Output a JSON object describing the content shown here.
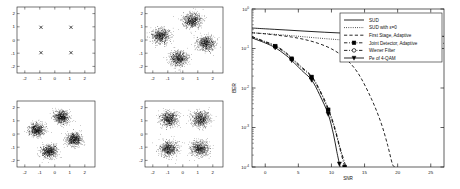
{
  "figure": {
    "background": "#ffffff",
    "axis_color": "#1a1a1a",
    "data_color": "#000000"
  },
  "chart_data": [
    {
      "id": "ideal-constellation",
      "type": "scatter",
      "title": "",
      "xlabel": "",
      "ylabel": "",
      "xlim": [
        -2.6,
        2.6
      ],
      "ylim": [
        -2.6,
        2.6
      ],
      "xticks": [
        -2,
        -1,
        0,
        1,
        2
      ],
      "yticks": [
        -2,
        -1,
        0,
        1,
        2
      ],
      "xticklabels": [
        "-2",
        "-1",
        "0",
        "1",
        "2"
      ],
      "yticklabels": [
        "-2",
        "-1",
        "0",
        "1",
        "2"
      ],
      "grid": false,
      "legend": "none",
      "marker": "x",
      "series": [
        {
          "name": "Ideal 4-QAM constellation points",
          "x": [
            -1,
            1,
            -1,
            1
          ],
          "y": [
            1,
            1,
            -1,
            -1
          ]
        }
      ]
    },
    {
      "id": "received-rotated-noisy",
      "type": "scatter",
      "title": "",
      "xlabel": "",
      "ylabel": "",
      "xlim": [
        -2.6,
        2.6
      ],
      "ylim": [
        -2.6,
        2.6
      ],
      "xticks": [
        -2,
        -1,
        0,
        1,
        2
      ],
      "yticks": [
        -2,
        -1,
        0,
        1,
        2
      ],
      "xticklabels": [
        "-2",
        "-1",
        "0",
        "1",
        "2"
      ],
      "yticklabels": [
        "-2",
        "-1",
        "0",
        "1",
        "2"
      ],
      "grid": false,
      "legend": "none",
      "marker": "dot",
      "cluster_rotation_deg": 32,
      "cluster_radius": 1.6,
      "cluster_spread": 0.3,
      "points_per_cluster": 700,
      "series": [
        {
          "name": "cluster-1",
          "center": [
            0.55,
            1.55
          ]
        },
        {
          "name": "cluster-2",
          "center": [
            -1.55,
            0.35
          ]
        },
        {
          "name": "cluster-3",
          "center": [
            1.45,
            -0.25
          ]
        },
        {
          "name": "cluster-4",
          "center": [
            -0.35,
            -1.45
          ]
        }
      ]
    },
    {
      "id": "partially-equalized-rotated",
      "type": "scatter",
      "title": "",
      "xlabel": "",
      "ylabel": "",
      "xlim": [
        -2.6,
        2.6
      ],
      "ylim": [
        -2.6,
        2.6
      ],
      "xticks": [
        -2,
        -1,
        0,
        1,
        2
      ],
      "yticks": [
        -2,
        -1,
        0,
        1,
        2
      ],
      "xticklabels": [
        "-2",
        "-1",
        "0",
        "1",
        "2"
      ],
      "yticklabels": [
        "-2",
        "-1",
        "0",
        "1",
        "2"
      ],
      "grid": false,
      "legend": "none",
      "marker": "dot",
      "cluster_rotation_deg": 25,
      "cluster_radius": 1.5,
      "cluster_spread": 0.26,
      "points_per_cluster": 700,
      "series": [
        {
          "name": "cluster-1",
          "center": [
            0.35,
            1.35
          ]
        },
        {
          "name": "cluster-2",
          "center": [
            -1.3,
            0.35
          ]
        },
        {
          "name": "cluster-3",
          "center": [
            1.2,
            -0.4
          ]
        },
        {
          "name": "cluster-4",
          "center": [
            -0.45,
            -1.35
          ]
        }
      ]
    },
    {
      "id": "equalized-aligned",
      "type": "scatter",
      "title": "",
      "xlabel": "",
      "ylabel": "",
      "xlim": [
        -2.6,
        2.6
      ],
      "ylim": [
        -2.6,
        2.6
      ],
      "xticks": [
        -2,
        -1,
        0,
        1,
        2
      ],
      "yticks": [
        -2,
        -1,
        0,
        1,
        2
      ],
      "xticklabels": [
        "-2",
        "-1",
        "0",
        "1",
        "2"
      ],
      "yticklabels": [
        "-2",
        "-1",
        "0",
        "1",
        "2"
      ],
      "grid": false,
      "legend": "none",
      "marker": "dot",
      "cluster_rotation_deg": 0,
      "cluster_radius": 1.4,
      "cluster_spread": 0.3,
      "points_per_cluster": 700,
      "series": [
        {
          "name": "cluster-1",
          "center": [
            -1.0,
            1.2
          ]
        },
        {
          "name": "cluster-2",
          "center": [
            1.1,
            1.2
          ]
        },
        {
          "name": "cluster-3",
          "center": [
            -1.05,
            -1.15
          ]
        },
        {
          "name": "cluster-4",
          "center": [
            1.05,
            -1.15
          ]
        }
      ]
    },
    {
      "id": "ber-vs-snr",
      "type": "line",
      "title": "",
      "xlabel": "SNR",
      "ylabel": "BER",
      "xlim": [
        -2,
        27
      ],
      "ylim": [
        0.0001,
        1
      ],
      "yscale": "log",
      "xticks": [
        0,
        5,
        10,
        15,
        20,
        25
      ],
      "xticklabels": [
        "0",
        "5",
        "10",
        "15",
        "20",
        "25"
      ],
      "yticks": [
        1,
        0.1,
        0.01,
        0.001,
        0.0001
      ],
      "yticklabels": [
        "10^0",
        "10^-1",
        "10^-2",
        "10^-3",
        "10^-4"
      ],
      "grid": false,
      "legend_position": "upper right",
      "series": [
        {
          "name": "SUD",
          "style": "solid",
          "marker": "none",
          "x": [
            -2,
            0,
            3,
            6,
            9,
            12,
            15,
            18,
            21,
            24,
            27
          ],
          "y": [
            0.33,
            0.315,
            0.295,
            0.275,
            0.258,
            0.244,
            0.232,
            0.222,
            0.214,
            0.208,
            0.203
          ]
        },
        {
          "name": "SUD with ε=0",
          "style": "dotted",
          "marker": "none",
          "x": [
            -2,
            0,
            3,
            6,
            9,
            12,
            15,
            18,
            21,
            24,
            27
          ],
          "y": [
            0.25,
            0.238,
            0.218,
            0.197,
            0.178,
            0.163,
            0.152,
            0.145,
            0.14,
            0.137,
            0.135
          ]
        },
        {
          "name": "First Stage, Adaptive",
          "style": "dashed",
          "marker": "none",
          "x": [
            -2,
            0,
            2,
            4,
            6,
            8,
            10,
            12,
            14,
            16,
            17.5,
            18.5,
            19.2,
            19.6
          ],
          "y": [
            0.25,
            0.235,
            0.215,
            0.195,
            0.168,
            0.135,
            0.098,
            0.058,
            0.024,
            0.0055,
            0.0013,
            0.00035,
            0.00012,
            0.0001
          ]
        },
        {
          "name": "Joint Detector, Adaptive",
          "style": "dashdot",
          "marker": "square",
          "markers_x": [
            1.5,
            4,
            7,
            9.5,
            12
          ],
          "markers_y": [
            0.115,
            0.055,
            0.019,
            0.0028,
            0.0001
          ],
          "x": [
            -2,
            0,
            1.5,
            3,
            4,
            5.5,
            7,
            8.2,
            9.5,
            10.5,
            11.3,
            12
          ],
          "y": [
            0.195,
            0.145,
            0.115,
            0.078,
            0.055,
            0.032,
            0.019,
            0.0085,
            0.0028,
            0.0009,
            0.00028,
            0.0001
          ]
        },
        {
          "name": "Wiener Filter",
          "style": "dashed-circle",
          "marker": "circle",
          "markers_x": [],
          "markers_y": [],
          "x": [
            -2,
            0,
            1.5,
            3,
            4,
            5.5,
            7,
            8.2,
            9.5,
            10.5,
            11.3,
            12.2
          ],
          "y": [
            0.2,
            0.15,
            0.12,
            0.082,
            0.058,
            0.034,
            0.02,
            0.0092,
            0.0031,
            0.001,
            0.00031,
            0.0001
          ]
        },
        {
          "name": "Pe of 4-QAM",
          "style": "solid-marker",
          "marker": "triangle-down",
          "markers_x": [
            1.5,
            4,
            7,
            9.5,
            11.2
          ],
          "markers_y": [
            0.105,
            0.05,
            0.016,
            0.0022,
            0.00012
          ],
          "x": [
            -2,
            0,
            1.5,
            3,
            4,
            5.5,
            7,
            8.2,
            9.5,
            10.3,
            10.8,
            11.3
          ],
          "y": [
            0.185,
            0.138,
            0.105,
            0.07,
            0.05,
            0.028,
            0.016,
            0.0068,
            0.0022,
            0.00068,
            0.00025,
            0.0001
          ]
        }
      ]
    }
  ],
  "legend": {
    "items": [
      {
        "label": "SUD",
        "style": "solid",
        "marker": "none"
      },
      {
        "label": "SUD with ε=0",
        "style": "dotted",
        "marker": "none"
      },
      {
        "label": "First Stage, Adaptive",
        "style": "dashed",
        "marker": "none"
      },
      {
        "label": "Joint Detector, Adaptive",
        "style": "dashdot",
        "marker": "square"
      },
      {
        "label": "Wiener Filter",
        "style": "dashdot",
        "marker": "circle"
      },
      {
        "label": "Pe of 4-QAM",
        "style": "solid",
        "marker": "triangle-down"
      }
    ]
  },
  "axis_labels": {
    "ber_x": "SNR",
    "ber_y": "BER"
  }
}
